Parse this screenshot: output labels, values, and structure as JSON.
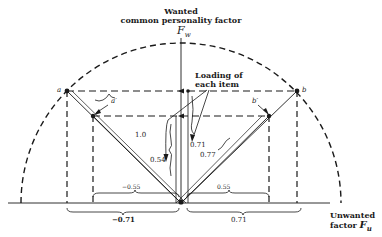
{
  "title": {
    "line1": "Wanted",
    "line2": "common personality factor",
    "symbol": "F",
    "subscript": "w"
  },
  "x_axis": {
    "line1": "Unwanted",
    "line2": "factor",
    "symbol": "F",
    "subscript": "u"
  },
  "annotation": {
    "line1": "Loading of",
    "line2": "each item"
  },
  "points": {
    "a": "a",
    "a_prime": "a′",
    "b": "b",
    "b_prime": "b′"
  },
  "values": {
    "vector_length": "1.0",
    "wanted_loading_a_prime": "0.54",
    "wanted_loading_a": "0.71",
    "vector_length_b_prime": "0.77",
    "unwanted_a_prime": "−0.55",
    "unwanted_a": "−0.71",
    "unwanted_b_prime": "0.55",
    "unwanted_b": "0.71"
  },
  "colors": {
    "ink": "#1a1a1a",
    "background": "#ffffff"
  }
}
